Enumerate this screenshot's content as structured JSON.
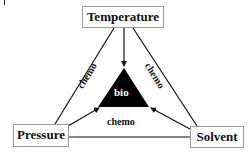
{
  "diagram": {
    "nodes": {
      "top": "Temperature",
      "left": "Pressure",
      "right": "Solvent",
      "center": "bio"
    },
    "edge_labels": {
      "left": "chemo",
      "right": "chemo",
      "bottom": "chemo"
    },
    "colors": {
      "line": "#111111",
      "center_fill": "#000000",
      "center_text": "#ffffff",
      "box_border": "#9a9a9a"
    }
  }
}
